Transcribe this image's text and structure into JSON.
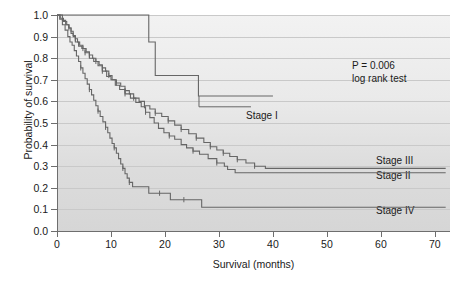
{
  "figure": {
    "type": "kaplan-meier-survival-plot",
    "background": "#ffffff",
    "plot_background_top": "#f2f2f2",
    "plot_background_bottom": "#d6d6d6",
    "gridline_color": "#c9c9c9",
    "axis_color": "#6e6e6e",
    "curve_color": "#666666"
  },
  "annotations": {
    "p_value": "P = 0.006",
    "test_name": "log rank test"
  },
  "labels": {
    "stage_1": "Stage I",
    "stage_2": "Stage II",
    "stage_3": "Stage III",
    "stage_4": "Stage IV"
  },
  "chart_data": {
    "type": "line",
    "title": "",
    "xlabel": "Survival (months)",
    "ylabel": "Probability of survival",
    "xlim": [
      0,
      72.8
    ],
    "ylim": [
      0.0,
      1.0
    ],
    "grid": true,
    "legend_position": "inline-right-annotations",
    "xticks": [
      0,
      10,
      20,
      30,
      40,
      50,
      60,
      70
    ],
    "xtick_labels": [
      "0",
      "10",
      "20",
      "30",
      "40",
      "50",
      "60",
      "70"
    ],
    "yticks": [
      0.0,
      0.1,
      0.2,
      0.3,
      0.4,
      0.5,
      0.6,
      0.7,
      0.8,
      0.9,
      1.0
    ],
    "ytick_labels": [
      "0.0",
      "0.1",
      "0.2",
      "0.3",
      "0.4",
      "0.5",
      "0.6",
      "0.7",
      "0.8",
      "0.9",
      "1.0"
    ],
    "step_style": "post",
    "series": [
      {
        "name": "Stage I",
        "points": [
          [
            0,
            1.0
          ],
          [
            17.0,
            1.0
          ],
          [
            17.0,
            0.875
          ],
          [
            18.2,
            0.875
          ],
          [
            18.2,
            0.72
          ],
          [
            26.2,
            0.72
          ],
          [
            26.2,
            0.625
          ],
          [
            40.0,
            0.625
          ]
        ],
        "censor_marks": []
      },
      {
        "name": "Stage II",
        "points": [
          [
            0,
            1.0
          ],
          [
            1.0,
            0.975
          ],
          [
            1.6,
            0.955
          ],
          [
            2.2,
            0.94
          ],
          [
            2.6,
            0.915
          ],
          [
            3.0,
            0.9
          ],
          [
            3.4,
            0.875
          ],
          [
            4.0,
            0.855
          ],
          [
            4.6,
            0.845
          ],
          [
            5.2,
            0.825
          ],
          [
            6.0,
            0.8
          ],
          [
            6.8,
            0.785
          ],
          [
            7.6,
            0.765
          ],
          [
            8.4,
            0.74
          ],
          [
            9.2,
            0.715
          ],
          [
            10.0,
            0.7
          ],
          [
            10.8,
            0.675
          ],
          [
            11.6,
            0.655
          ],
          [
            12.6,
            0.635
          ],
          [
            13.6,
            0.615
          ],
          [
            14.6,
            0.595
          ],
          [
            15.6,
            0.575
          ],
          [
            16.4,
            0.55
          ],
          [
            17.2,
            0.525
          ],
          [
            18.0,
            0.5
          ],
          [
            18.8,
            0.475
          ],
          [
            19.8,
            0.455
          ],
          [
            20.8,
            0.44
          ],
          [
            21.8,
            0.425
          ],
          [
            23.0,
            0.4
          ],
          [
            24.0,
            0.385
          ],
          [
            25.2,
            0.37
          ],
          [
            26.4,
            0.355
          ],
          [
            28.0,
            0.335
          ],
          [
            29.6,
            0.315
          ],
          [
            31.0,
            0.3
          ],
          [
            31.6,
            0.285
          ],
          [
            33.0,
            0.27
          ],
          [
            72.0,
            0.27
          ]
        ],
        "censor_marks": [
          [
            5.2,
            0.825
          ],
          [
            8.4,
            0.74
          ],
          [
            12.6,
            0.635
          ],
          [
            16.4,
            0.55
          ],
          [
            20.8,
            0.44
          ],
          [
            25.2,
            0.37
          ],
          [
            29.6,
            0.315
          ]
        ]
      },
      {
        "name": "Stage III",
        "points": [
          [
            0,
            1.0
          ],
          [
            0.6,
            0.985
          ],
          [
            1.2,
            0.97
          ],
          [
            1.8,
            0.955
          ],
          [
            2.2,
            0.94
          ],
          [
            2.6,
            0.925
          ],
          [
            3.0,
            0.905
          ],
          [
            3.4,
            0.89
          ],
          [
            3.8,
            0.875
          ],
          [
            4.2,
            0.86
          ],
          [
            4.8,
            0.845
          ],
          [
            5.4,
            0.83
          ],
          [
            6.0,
            0.815
          ],
          [
            6.6,
            0.8
          ],
          [
            7.2,
            0.785
          ],
          [
            7.8,
            0.77
          ],
          [
            8.4,
            0.755
          ],
          [
            9.0,
            0.74
          ],
          [
            9.6,
            0.72
          ],
          [
            10.2,
            0.7
          ],
          [
            11.0,
            0.685
          ],
          [
            11.8,
            0.67
          ],
          [
            12.6,
            0.65
          ],
          [
            13.4,
            0.635
          ],
          [
            14.2,
            0.615
          ],
          [
            15.2,
            0.6
          ],
          [
            16.2,
            0.58
          ],
          [
            17.2,
            0.565
          ],
          [
            18.2,
            0.545
          ],
          [
            19.4,
            0.53
          ],
          [
            20.6,
            0.51
          ],
          [
            21.8,
            0.49
          ],
          [
            23.0,
            0.47
          ],
          [
            24.4,
            0.45
          ],
          [
            25.8,
            0.43
          ],
          [
            27.2,
            0.41
          ],
          [
            28.4,
            0.39
          ],
          [
            29.6,
            0.375
          ],
          [
            30.8,
            0.36
          ],
          [
            32.0,
            0.345
          ],
          [
            33.4,
            0.33
          ],
          [
            35.0,
            0.315
          ],
          [
            36.6,
            0.3
          ],
          [
            38.6,
            0.29
          ],
          [
            72.0,
            0.29
          ]
        ],
        "censor_marks": [
          [
            2.2,
            0.94
          ],
          [
            3.4,
            0.89
          ],
          [
            4.8,
            0.845
          ],
          [
            6.0,
            0.815
          ],
          [
            7.2,
            0.785
          ],
          [
            8.4,
            0.755
          ],
          [
            9.6,
            0.72
          ],
          [
            11.0,
            0.685
          ],
          [
            12.6,
            0.65
          ],
          [
            14.2,
            0.615
          ],
          [
            16.2,
            0.58
          ],
          [
            18.2,
            0.545
          ],
          [
            20.6,
            0.51
          ],
          [
            23.0,
            0.47
          ],
          [
            25.8,
            0.43
          ],
          [
            28.4,
            0.39
          ],
          [
            30.8,
            0.36
          ],
          [
            33.4,
            0.33
          ],
          [
            36.6,
            0.3
          ]
        ]
      },
      {
        "name": "Stage IV",
        "points": [
          [
            0,
            1.0
          ],
          [
            0.5,
            0.98
          ],
          [
            1.0,
            0.955
          ],
          [
            1.5,
            0.93
          ],
          [
            2.0,
            0.9
          ],
          [
            2.4,
            0.875
          ],
          [
            2.8,
            0.86
          ],
          [
            3.2,
            0.835
          ],
          [
            3.6,
            0.81
          ],
          [
            4.0,
            0.785
          ],
          [
            4.4,
            0.755
          ],
          [
            4.8,
            0.73
          ],
          [
            5.2,
            0.705
          ],
          [
            5.6,
            0.68
          ],
          [
            6.0,
            0.655
          ],
          [
            6.4,
            0.63
          ],
          [
            6.8,
            0.605
          ],
          [
            7.2,
            0.58
          ],
          [
            7.6,
            0.555
          ],
          [
            8.0,
            0.53
          ],
          [
            8.5,
            0.505
          ],
          [
            9.0,
            0.48
          ],
          [
            9.4,
            0.455
          ],
          [
            9.8,
            0.43
          ],
          [
            10.2,
            0.405
          ],
          [
            10.6,
            0.385
          ],
          [
            11.0,
            0.36
          ],
          [
            11.4,
            0.335
          ],
          [
            11.8,
            0.31
          ],
          [
            12.2,
            0.29
          ],
          [
            12.6,
            0.265
          ],
          [
            13.0,
            0.245
          ],
          [
            13.4,
            0.225
          ],
          [
            14.0,
            0.205
          ],
          [
            17.0,
            0.205
          ],
          [
            17.0,
            0.175
          ],
          [
            21.0,
            0.175
          ],
          [
            21.0,
            0.145
          ],
          [
            26.8,
            0.145
          ],
          [
            26.8,
            0.11
          ],
          [
            72.0,
            0.11
          ]
        ],
        "censor_marks": [
          [
            4.4,
            0.755
          ],
          [
            6.0,
            0.655
          ],
          [
            7.6,
            0.555
          ],
          [
            9.0,
            0.48
          ],
          [
            10.6,
            0.385
          ],
          [
            12.2,
            0.29
          ],
          [
            13.4,
            0.225
          ],
          [
            19.0,
            0.175
          ],
          [
            23.5,
            0.145
          ]
        ]
      }
    ]
  }
}
